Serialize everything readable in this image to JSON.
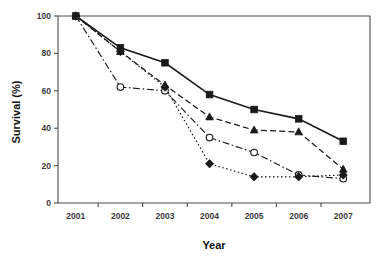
{
  "chart_data": {
    "type": "line",
    "title": "",
    "xlabel": "Year",
    "ylabel": "Survival (%)",
    "x": [
      2001,
      2002,
      2003,
      2004,
      2005,
      2006,
      2007
    ],
    "xticklabels": [
      "2001",
      "2002",
      "2003",
      "2004",
      "2005",
      "2006",
      "2007"
    ],
    "yticklabels": [
      "0",
      "20",
      "40",
      "60",
      "80",
      "100"
    ],
    "yticks": [
      0,
      20,
      40,
      60,
      80,
      100
    ],
    "ylim": [
      0,
      100
    ],
    "xlim": [
      2000.6,
      2007.6
    ],
    "grid": false,
    "legend": "none",
    "series": [
      {
        "name": "series-1",
        "marker": "filled-square",
        "linestyle": "solid",
        "color": "#1a1a1a",
        "values": [
          100,
          83,
          75,
          58,
          50,
          45,
          33
        ]
      },
      {
        "name": "series-2",
        "marker": "filled-triangle",
        "linestyle": "dashed",
        "color": "#1a1a1a",
        "values": [
          100,
          81,
          63,
          46,
          39,
          38,
          18
        ]
      },
      {
        "name": "series-3",
        "marker": "open-circle",
        "linestyle": "dash-dot",
        "color": "#1a1a1a",
        "values": [
          100,
          62,
          60,
          35,
          27,
          15,
          13
        ]
      },
      {
        "name": "series-4",
        "marker": "filled-diamond",
        "linestyle": "dotted",
        "color": "#1a1a1a",
        "values": [
          100,
          81,
          62,
          21,
          14,
          14,
          15
        ]
      }
    ]
  }
}
